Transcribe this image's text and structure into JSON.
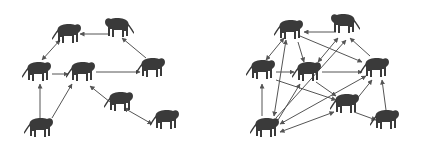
{
  "figure": {
    "panels": [
      {
        "name": "sparse-network",
        "nodes": [
          {
            "id": "a",
            "x": 68,
            "y": 34,
            "facing": "right"
          },
          {
            "id": "b",
            "x": 118,
            "y": 28,
            "facing": "left"
          },
          {
            "id": "c",
            "x": 38,
            "y": 72,
            "facing": "right"
          },
          {
            "id": "d",
            "x": 82,
            "y": 72,
            "facing": "right"
          },
          {
            "id": "e",
            "x": 152,
            "y": 68,
            "facing": "right"
          },
          {
            "id": "f",
            "x": 120,
            "y": 102,
            "facing": "right"
          },
          {
            "id": "g",
            "x": 40,
            "y": 128,
            "facing": "right"
          },
          {
            "id": "h",
            "x": 166,
            "y": 120,
            "facing": "right"
          }
        ],
        "edges": [
          {
            "from": "b",
            "to": "a",
            "x1": 108,
            "y1": 34,
            "x2": 80,
            "y2": 34
          },
          {
            "from": "e",
            "to": "b",
            "x1": 146,
            "y1": 58,
            "x2": 122,
            "y2": 38
          },
          {
            "from": "a",
            "to": "c",
            "x1": 60,
            "y1": 40,
            "x2": 42,
            "y2": 60,
            "double": true
          },
          {
            "from": "c",
            "to": "d",
            "x1": 52,
            "y1": 74,
            "x2": 68,
            "y2": 74
          },
          {
            "from": "d",
            "to": "e",
            "x1": 96,
            "y1": 72,
            "x2": 140,
            "y2": 72
          },
          {
            "from": "g",
            "to": "c",
            "x1": 40,
            "y1": 118,
            "x2": 40,
            "y2": 84
          },
          {
            "from": "g",
            "to": "d",
            "x1": 52,
            "y1": 118,
            "x2": 72,
            "y2": 84
          },
          {
            "from": "f",
            "to": "d",
            "x1": 110,
            "y1": 102,
            "x2": 90,
            "y2": 86
          },
          {
            "from": "f",
            "to": "h",
            "x1": 124,
            "y1": 108,
            "x2": 152,
            "y2": 124,
            "double": true
          }
        ]
      },
      {
        "name": "dense-network",
        "nodes": [
          {
            "id": "a",
            "x": 290,
            "y": 30,
            "facing": "right"
          },
          {
            "id": "b",
            "x": 344,
            "y": 24,
            "facing": "left"
          },
          {
            "id": "c",
            "x": 262,
            "y": 70,
            "facing": "right"
          },
          {
            "id": "d",
            "x": 308,
            "y": 72,
            "facing": "right"
          },
          {
            "id": "e",
            "x": 376,
            "y": 68,
            "facing": "right"
          },
          {
            "id": "f",
            "x": 346,
            "y": 104,
            "facing": "right"
          },
          {
            "id": "g",
            "x": 266,
            "y": 128,
            "facing": "right"
          },
          {
            "id": "h",
            "x": 386,
            "y": 120,
            "facing": "right"
          }
        ],
        "edges": [
          {
            "x1": 336,
            "y1": 32,
            "x2": 304,
            "y2": 32
          },
          {
            "x1": 284,
            "y1": 38,
            "x2": 266,
            "y2": 60,
            "double": true
          },
          {
            "x1": 300,
            "y1": 36,
            "x2": 362,
            "y2": 62
          },
          {
            "x1": 298,
            "y1": 42,
            "x2": 304,
            "y2": 62
          },
          {
            "x1": 338,
            "y1": 38,
            "x2": 318,
            "y2": 62,
            "double": true
          },
          {
            "x1": 370,
            "y1": 56,
            "x2": 350,
            "y2": 38
          },
          {
            "x1": 276,
            "y1": 72,
            "x2": 294,
            "y2": 72
          },
          {
            "x1": 322,
            "y1": 72,
            "x2": 362,
            "y2": 72
          },
          {
            "x1": 276,
            "y1": 80,
            "x2": 336,
            "y2": 100
          },
          {
            "x1": 262,
            "y1": 116,
            "x2": 262,
            "y2": 84
          },
          {
            "x1": 274,
            "y1": 116,
            "x2": 286,
            "y2": 40,
            "double": true
          },
          {
            "x1": 276,
            "y1": 118,
            "x2": 346,
            "y2": 40
          },
          {
            "x1": 278,
            "y1": 120,
            "x2": 300,
            "y2": 84
          },
          {
            "x1": 280,
            "y1": 124,
            "x2": 366,
            "y2": 76,
            "double": true
          },
          {
            "x1": 280,
            "y1": 132,
            "x2": 334,
            "y2": 112,
            "double": true
          },
          {
            "x1": 316,
            "y1": 82,
            "x2": 336,
            "y2": 96
          },
          {
            "x1": 356,
            "y1": 100,
            "x2": 372,
            "y2": 80
          },
          {
            "x1": 354,
            "y1": 112,
            "x2": 376,
            "y2": 120
          },
          {
            "x1": 386,
            "y1": 110,
            "x2": 382,
            "y2": 80
          }
        ]
      }
    ]
  }
}
